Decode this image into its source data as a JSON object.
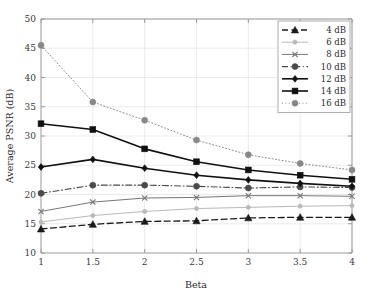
{
  "chart_data": {
    "type": "line",
    "title": "",
    "xlabel": "Beta",
    "ylabel": "Average PSNR (dB)",
    "x": [
      1,
      1.5,
      2,
      2.5,
      3,
      3.5,
      4
    ],
    "xticklabels": [
      "1",
      "1.5",
      "2",
      "2.5",
      "3",
      "3.5",
      "4"
    ],
    "yticklabels": [
      "10",
      "15",
      "20",
      "25",
      "30",
      "35",
      "40",
      "45",
      "50"
    ],
    "yticks": [
      10,
      15,
      20,
      25,
      30,
      35,
      40,
      45,
      50
    ],
    "xlim": [
      1,
      4
    ],
    "ylim": [
      10,
      50
    ],
    "grid": true,
    "legend_position": "upper right",
    "series": [
      {
        "name": "4 dB",
        "values": [
          14.1,
          14.9,
          15.4,
          15.5,
          16.0,
          16.1,
          16.1
        ],
        "marker": "triangle",
        "linestyle": "dashed",
        "color": "#1a1a1a",
        "linewidth": 1.3
      },
      {
        "name": "6 dB",
        "values": [
          15.3,
          16.4,
          17.1,
          17.6,
          17.8,
          18.0,
          18.1
        ],
        "marker": "circle-small",
        "linestyle": "solid",
        "color": "#b9b9b9",
        "linewidth": 1.0
      },
      {
        "name": "8 dB",
        "values": [
          17.1,
          18.7,
          19.4,
          19.5,
          19.8,
          19.8,
          19.7
        ],
        "marker": "cross",
        "linestyle": "solid",
        "color": "#777777",
        "linewidth": 1.0
      },
      {
        "name": "10 dB",
        "values": [
          20.2,
          21.6,
          21.6,
          21.4,
          21.1,
          21.3,
          21.2
        ],
        "marker": "circle",
        "linestyle": "dashdot",
        "color": "#4a4a4a",
        "linewidth": 1.1
      },
      {
        "name": "12 dB",
        "values": [
          24.7,
          26.0,
          24.5,
          23.3,
          22.5,
          21.9,
          21.4
        ],
        "marker": "diamond",
        "linestyle": "solid",
        "color": "#111111",
        "linewidth": 1.6
      },
      {
        "name": "14 dB",
        "values": [
          32.1,
          31.1,
          27.8,
          25.6,
          24.2,
          23.3,
          22.6
        ],
        "marker": "square",
        "linestyle": "solid",
        "color": "#111111",
        "linewidth": 1.6
      },
      {
        "name": "16 dB",
        "values": [
          45.5,
          35.8,
          32.7,
          29.3,
          26.8,
          25.3,
          24.2
        ],
        "marker": "circle",
        "linestyle": "dotted",
        "color": "#888888",
        "linewidth": 1.0
      }
    ]
  },
  "legend": {
    "entries": [
      {
        "label": "4 dB"
      },
      {
        "label": "6 dB"
      },
      {
        "label": "8 dB"
      },
      {
        "label": "10 dB"
      },
      {
        "label": "12 dB"
      },
      {
        "label": "14 dB"
      },
      {
        "label": "16 dB"
      }
    ]
  },
  "axes": {
    "x_title": "Beta",
    "y_title": "Average PSNR (dB)"
  },
  "colors": {
    "axis": "#9a9a9a",
    "grid": "#e2e2e2",
    "text": "#2b2b2b",
    "background": "#ffffff"
  }
}
